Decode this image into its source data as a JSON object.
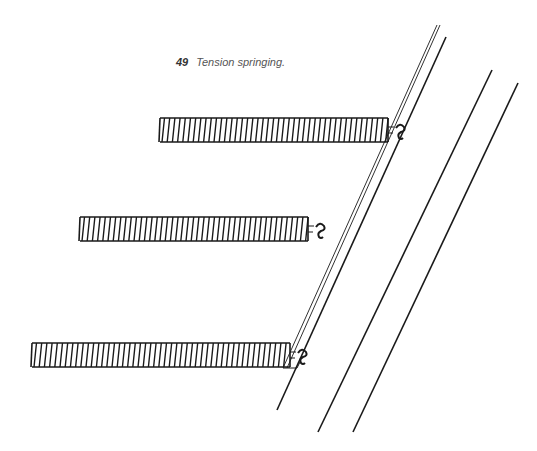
{
  "figure": {
    "number": "49",
    "caption": "Tension springing."
  },
  "colors": {
    "ink": "#1a1a1a",
    "caption": "#555555",
    "background": "#ffffff"
  },
  "springs": [
    {
      "name": "top-spring",
      "x1": 160,
      "x2": 388,
      "y": 130,
      "height": 24
    },
    {
      "name": "middle-spring",
      "x1": 80,
      "x2": 308,
      "y": 229,
      "height": 24
    },
    {
      "name": "bottom-spring",
      "x1": 32,
      "x2": 290,
      "y": 355,
      "height": 24
    }
  ],
  "lines": [
    {
      "name": "frame-rail-double-outer",
      "x1": 437,
      "y1": 25,
      "x2": 283,
      "y2": 368
    },
    {
      "name": "frame-rail-double-inner",
      "x1": 440,
      "y1": 25,
      "x2": 287,
      "y2": 368
    },
    {
      "name": "frame-rail",
      "x1": 446,
      "y1": 37,
      "x2": 277,
      "y2": 410
    },
    {
      "name": "seat-rail-left",
      "x1": 492,
      "y1": 70,
      "x2": 318,
      "y2": 432
    },
    {
      "name": "seat-rail-right",
      "x1": 518,
      "y1": 83,
      "x2": 353,
      "y2": 432
    }
  ]
}
